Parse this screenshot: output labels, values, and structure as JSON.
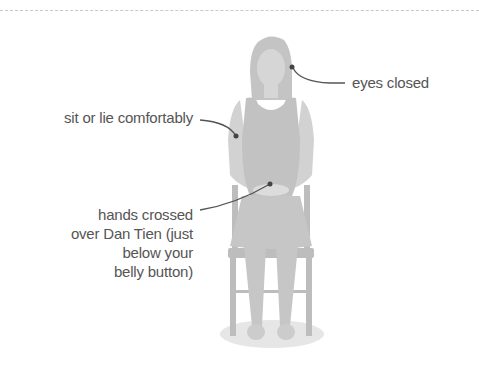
{
  "diagram": {
    "colors": {
      "figure": "#c8c8c8",
      "figure_dark": "#b5b5b5",
      "figure_light": "#d9d9d9",
      "chair": "#bdbdbd",
      "shadow": "#e6e6e6",
      "leader_line": "#555555",
      "text": "#555555",
      "border": "#c8c8c8"
    },
    "labels": {
      "eyes": "eyes closed",
      "posture": "sit or lie comfortably",
      "hands": "hands crossed\nover Dan Tien (just\nbelow your\nbelly button)"
    }
  }
}
